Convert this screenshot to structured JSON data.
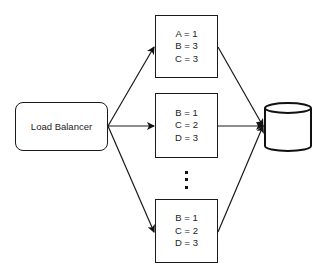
{
  "diagram": {
    "load_balancer": {
      "label": "Load Balancer"
    },
    "servers": [
      {
        "lines": [
          "A = 1",
          "B = 3",
          "C = 3"
        ]
      },
      {
        "lines": [
          "B = 1",
          "C = 2",
          "D = 3"
        ]
      },
      {
        "lines": [
          "B = 1",
          "C = 2",
          "D = 3"
        ]
      }
    ],
    "database": {
      "shape": "cylinder"
    },
    "ellipsis": "vertical-dots",
    "colors": {
      "stroke": "#1a1a1a",
      "background": "#ffffff",
      "text": "#222222"
    }
  }
}
